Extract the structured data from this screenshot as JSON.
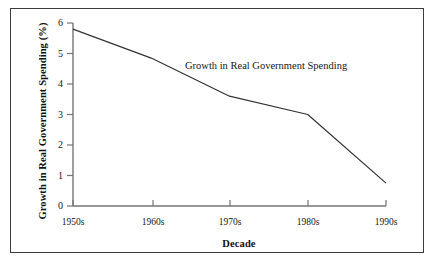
{
  "figure": {
    "background_color": "#ffffff",
    "border_color": "#3c3c3c"
  },
  "chart_data": {
    "type": "line",
    "title": "",
    "xlabel": "Decade",
    "ylabel": "Growth in Real Government Spending (%)",
    "categories": [
      "1950s",
      "1960s",
      "1970s",
      "1980s",
      "1990s"
    ],
    "values": [
      5.8,
      4.85,
      3.6,
      3.0,
      0.75
    ],
    "series": [
      {
        "name": "Growth in Real Government Spending",
        "values": [
          5.8,
          4.85,
          3.6,
          3.0,
          0.75
        ],
        "color": "#333333"
      }
    ],
    "annotations": [
      {
        "text": "Growth in Real Government Spending",
        "x": "1960s-1980s",
        "y": 5.05
      }
    ],
    "ylim": [
      0,
      6
    ],
    "yticks": [
      0,
      1,
      2,
      3,
      4,
      5,
      6
    ],
    "ytick_labels": [
      "0",
      "1",
      "2",
      "3",
      "4",
      "5",
      "6"
    ],
    "xtick_labels": [
      "1950s",
      "1960s",
      "1970s",
      "1980s",
      "1990s"
    ],
    "grid": false,
    "legend_position": "none",
    "axis_color": "#757575",
    "line_color": "#333333"
  }
}
